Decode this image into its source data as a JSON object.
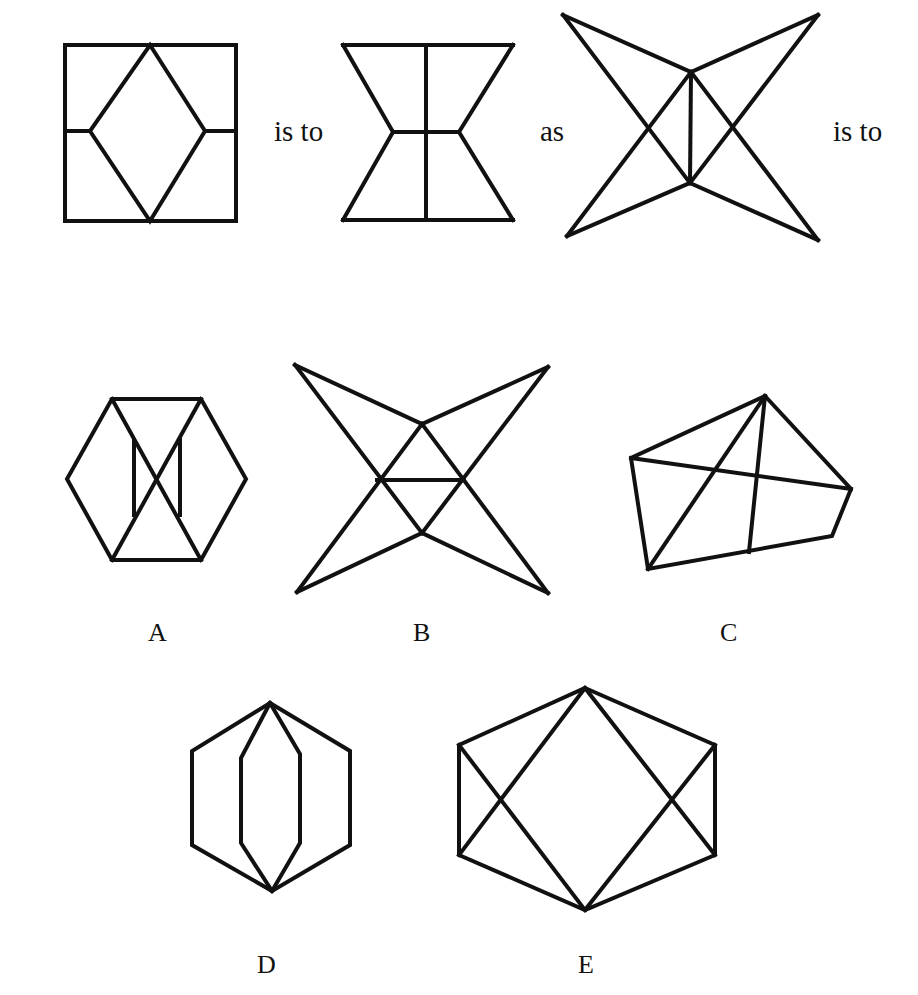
{
  "question": {
    "connectors": {
      "first": "is to",
      "second": "as",
      "third": "is to"
    },
    "figures": [
      {
        "id": "fig1",
        "description": "square with inscribed diamond and horizontal midline stubs"
      },
      {
        "id": "fig2",
        "description": "hourglass with vertical center line and horizontal waist"
      },
      {
        "id": "fig3",
        "description": "four-pointed star with vertical center segment"
      }
    ]
  },
  "options": [
    {
      "label": "A",
      "description": "hexagon with crossing diagonals and two short vertical bars"
    },
    {
      "label": "B",
      "description": "four-pointed star with horizontal center segment"
    },
    {
      "label": "C",
      "description": "irregular pentagon with internal lines"
    },
    {
      "label": "D",
      "description": "hexagon with inner elongated hexagon sharing top and bottom vertices"
    },
    {
      "label": "E",
      "description": "hexagon with inscribed diamond and crossing side diagonals"
    }
  ],
  "colors": {
    "stroke": "#111111",
    "background": "#ffffff"
  }
}
